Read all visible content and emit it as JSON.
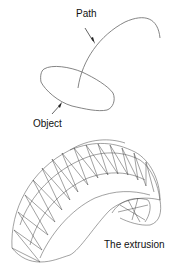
{
  "labels": {
    "path": "Path",
    "object": "Object",
    "extrusion": "The extrusion"
  },
  "colors": {
    "line": "#555555",
    "mesh": "#444444",
    "text": "#111111",
    "background": "#ffffff"
  }
}
